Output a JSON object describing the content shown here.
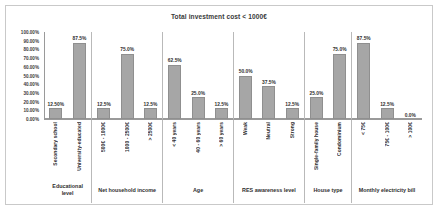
{
  "chart_data": {
    "type": "bar",
    "title": "Total investment cost < 1000€",
    "xlabel": "",
    "ylabel": "",
    "ylim": [
      0,
      100
    ],
    "grid": false,
    "legend": null,
    "ytick_labels": [
      "100.00%",
      "90.00%",
      "80.00%",
      "70.00%",
      "60.00%",
      "50.00%",
      "40.00%",
      "30.00%",
      "20.00%",
      "10.00%",
      "0.00%"
    ],
    "ytick_values": [
      100,
      90,
      80,
      70,
      60,
      50,
      40,
      30,
      20,
      10,
      0
    ],
    "bar_color": "#a6a6a6",
    "categories": [
      "Secondary school",
      "University-educated",
      "500€ - 1000€",
      "1000 - 2500€",
      "> 2500€",
      "< 40 years",
      "40 - 60 years",
      "> 60 years",
      "Weak",
      "Neutral",
      "Strong",
      "Single-family house",
      "Condominium",
      "< 75€",
      "75€ - 100€",
      "> 100€"
    ],
    "values": [
      12.5,
      87.5,
      12.5,
      75.0,
      12.5,
      62.5,
      25.0,
      12.5,
      50.0,
      37.5,
      12.5,
      25.0,
      75.0,
      87.5,
      12.5,
      0.0
    ],
    "data_labels": [
      "12.50%",
      "87.5%",
      "12.5%",
      "75.0%",
      "12.5%",
      "62.5%",
      "25.0%",
      "12.5%",
      "50.0%",
      "37.5%",
      "12.5%",
      "25.0%",
      "75.0%",
      "87.5%",
      "12.5%",
      "0.0%"
    ],
    "groups": [
      {
        "name": "Educational level",
        "bars": [
          {
            "label": "Secondary school",
            "value": 12.5,
            "display": "12.50%"
          },
          {
            "label": "University-educated",
            "value": 87.5,
            "display": "87.5%"
          }
        ]
      },
      {
        "name": "Net household income",
        "bars": [
          {
            "label": "500€ - 1000€",
            "value": 12.5,
            "display": "12.5%"
          },
          {
            "label": "1000 - 2500€",
            "value": 75.0,
            "display": "75.0%"
          },
          {
            "label": "> 2500€",
            "value": 12.5,
            "display": "12.5%"
          }
        ]
      },
      {
        "name": "Age",
        "bars": [
          {
            "label": "< 40 years",
            "value": 62.5,
            "display": "62.5%"
          },
          {
            "label": "40 - 60 years",
            "value": 25.0,
            "display": "25.0%"
          },
          {
            "label": "> 60 years",
            "value": 12.5,
            "display": "12.5%"
          }
        ]
      },
      {
        "name": "RES awareness level",
        "bars": [
          {
            "label": "Weak",
            "value": 50.0,
            "display": "50.0%"
          },
          {
            "label": "Neutral",
            "value": 37.5,
            "display": "37.5%"
          },
          {
            "label": "Strong",
            "value": 12.5,
            "display": "12.5%"
          }
        ]
      },
      {
        "name": "House type",
        "bars": [
          {
            "label": "Single-family house",
            "value": 25.0,
            "display": "25.0%"
          },
          {
            "label": "Condominium",
            "value": 75.0,
            "display": "75.0%"
          }
        ]
      },
      {
        "name": "Monthly electricity bill",
        "bars": [
          {
            "label": "< 75€",
            "value": 87.5,
            "display": "87.5%"
          },
          {
            "label": "75€ - 100€",
            "value": 12.5,
            "display": "12.5%"
          },
          {
            "label": "> 100€",
            "value": 0.0,
            "display": "0.0%"
          }
        ]
      }
    ]
  }
}
